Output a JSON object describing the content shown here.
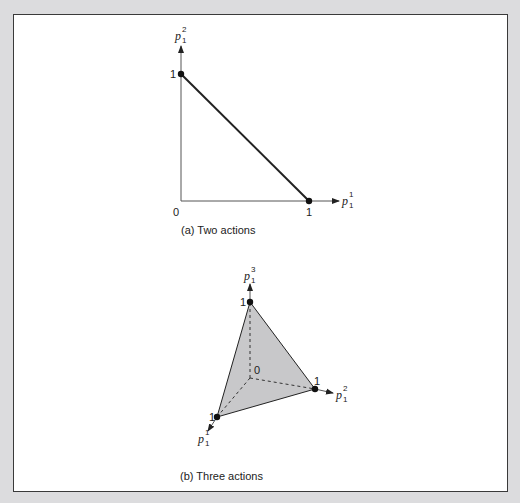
{
  "figure": {
    "panel_a": {
      "caption": "(a) Two actions",
      "y_axis_label": {
        "base": "p",
        "sub": "1",
        "sup": "2"
      },
      "x_axis_label": {
        "base": "p",
        "sub": "1",
        "sup": "1"
      },
      "origin_label": "0",
      "y_tick_label": "1",
      "x_tick_label": "1",
      "simplex": "line segment from (0,1) to (1,0)"
    },
    "panel_b": {
      "caption": "(b) Three actions",
      "axis_1_label": {
        "base": "p",
        "sub": "1",
        "sup": "1"
      },
      "axis_2_label": {
        "base": "p",
        "sub": "1",
        "sup": "2"
      },
      "axis_3_label": {
        "base": "p",
        "sub": "1",
        "sup": "3"
      },
      "origin_label": "0",
      "vertex_1_label": "1",
      "vertex_2_label": "1",
      "vertex_3_label": "1",
      "simplex": "shaded triangle with vertices on each axis at 1",
      "fill_color": "#c8c8ca"
    }
  },
  "colors": {
    "background": "#dcdcde",
    "frame": "#ffffff",
    "stroke": "#222222",
    "shade": "#c8c8ca"
  }
}
